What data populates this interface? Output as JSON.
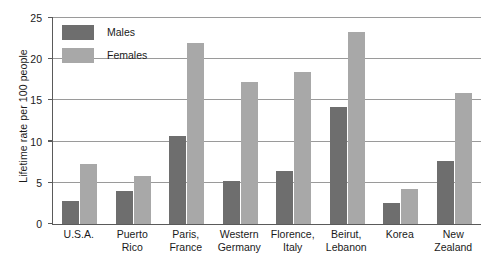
{
  "chart_data": {
    "type": "bar",
    "title": "",
    "subtitle": "",
    "xlabel": "",
    "ylabel": "Lifetime rate per 100 people",
    "ylim": [
      0,
      25
    ],
    "yticks": [
      0,
      5,
      10,
      15,
      20,
      25
    ],
    "ytick_labels": [
      "0",
      "5",
      "10",
      "15",
      "20",
      "25"
    ],
    "grid": true,
    "legend_position": "top-left",
    "categories": [
      "U.S.A.",
      "Puerto Rico",
      "Paris, France",
      "Western Germany",
      "Florence, Italy",
      "Beirut, Lebanon",
      "Korea",
      "New Zealand"
    ],
    "category_lines": [
      [
        "U.S.A."
      ],
      [
        "Puerto",
        "Rico"
      ],
      [
        "Paris,",
        "France"
      ],
      [
        "Western",
        "Germany"
      ],
      [
        "Florence,",
        "Italy"
      ],
      [
        "Beirut,",
        "Lebanon"
      ],
      [
        "Korea"
      ],
      [
        "New",
        "Zealand"
      ]
    ],
    "series": [
      {
        "name": "Males",
        "color": "#6e6e6e",
        "values": [
          2.8,
          4.0,
          10.7,
          5.2,
          6.4,
          14.2,
          2.5,
          7.6
        ]
      },
      {
        "name": "Females",
        "color": "#a8a8a8",
        "values": [
          7.3,
          5.8,
          22.0,
          17.2,
          18.4,
          23.3,
          4.2,
          15.9
        ]
      }
    ]
  },
  "legend": {
    "items": [
      {
        "label": "Males",
        "color": "#6e6e6e"
      },
      {
        "label": "Females",
        "color": "#a8a8a8"
      }
    ]
  },
  "axis": {
    "y_title": "Lifetime rate per 100 people"
  },
  "colors": {
    "male_bar": "#6e6e6e",
    "female_bar": "#a8a8a8",
    "gridline": "#9a9a9a",
    "axis": "#5a5a5a",
    "text": "#1a1a1a",
    "background": "#ffffff"
  }
}
